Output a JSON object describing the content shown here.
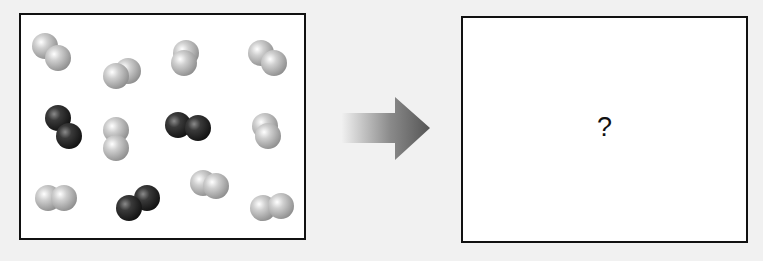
{
  "diagram": {
    "type": "reaction-before-after",
    "left_panel": {
      "description": "Mixture of diatomic molecules before reaction",
      "atom_radius": 13,
      "colors": {
        "light": "#c4c4c4",
        "light_highlight": "#ffffff",
        "light_shadow": "#8e8e8e",
        "dark": "#3a3a3a",
        "dark_highlight": "#8a8a8a",
        "dark_shadow": "#111111"
      },
      "counts": {
        "light_molecules": 9,
        "dark_molecules": 3
      },
      "molecules": [
        {
          "kind": "light",
          "atoms": [
            [
              24,
              31
            ],
            [
              37,
              43
            ]
          ]
        },
        {
          "kind": "light",
          "atoms": [
            [
              107,
              56
            ],
            [
              95,
              61
            ]
          ]
        },
        {
          "kind": "light",
          "atoms": [
            [
              165,
              38
            ],
            [
              163,
              48
            ]
          ]
        },
        {
          "kind": "light",
          "atoms": [
            [
              240,
              38
            ],
            [
              253,
              48
            ]
          ]
        },
        {
          "kind": "dark",
          "atoms": [
            [
              37,
              103
            ],
            [
              48,
              121
            ]
          ]
        },
        {
          "kind": "light",
          "atoms": [
            [
              95,
              115
            ],
            [
              95,
              133
            ]
          ]
        },
        {
          "kind": "dark",
          "atoms": [
            [
              157,
              110
            ],
            [
              177,
              113
            ]
          ]
        },
        {
          "kind": "light",
          "atoms": [
            [
              244,
              111
            ],
            [
              247,
              121
            ]
          ]
        },
        {
          "kind": "light",
          "atoms": [
            [
              27,
              183
            ],
            [
              43,
              183
            ]
          ]
        },
        {
          "kind": "dark",
          "atoms": [
            [
              126,
              183
            ],
            [
              108,
              193
            ]
          ]
        },
        {
          "kind": "light",
          "atoms": [
            [
              182,
              168
            ],
            [
              195,
              171
            ]
          ]
        },
        {
          "kind": "light",
          "atoms": [
            [
              242,
              193
            ],
            [
              260,
              191
            ]
          ]
        }
      ]
    },
    "arrow": {
      "direction": "right",
      "color_start": "#f0f0f0",
      "color_end": "#555555"
    },
    "right_panel": {
      "description": "Unknown product state",
      "label": "?"
    }
  }
}
